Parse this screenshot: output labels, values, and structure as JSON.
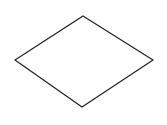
{
  "diagram": {
    "shape": "diamond",
    "stroke": "#222222",
    "fill": "#ffffff",
    "stroke_width": 1.2,
    "points": "83,16 153,60 82,107 15,60"
  }
}
